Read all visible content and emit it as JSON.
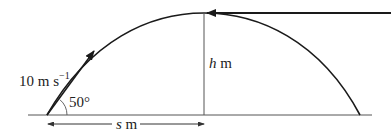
{
  "diagram": {
    "type": "projectile-motion",
    "labels": {
      "speed_value": "10 m s",
      "speed_exponent": "−1",
      "angle": "50°",
      "height_var": "h",
      "height_unit": " m",
      "distance_var": "s",
      "distance_unit": " m"
    },
    "colors": {
      "stroke": "#1a1a1a",
      "thin": "#444444",
      "text": "#222222"
    }
  }
}
